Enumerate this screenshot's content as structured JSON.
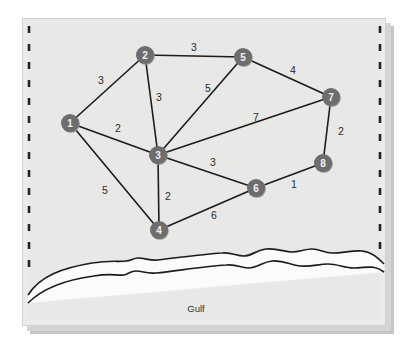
{
  "figure": {
    "region_label": "Gulf",
    "background_color": "#e8e8e6",
    "node_color": "#6d6d6d",
    "node_text_color": "#f2f2f2",
    "edge_color": "#1c1c1c",
    "border_color": "#1c1c1c",
    "shadow_color": "#b8b8b8",
    "frame_color": "#dcdcda"
  },
  "chart_data": {
    "type": "diagram",
    "nodes": [
      {
        "id": "1",
        "label": "1",
        "x": 70,
        "y": 123
      },
      {
        "id": "2",
        "label": "2",
        "x": 145,
        "y": 55
      },
      {
        "id": "3",
        "label": "3",
        "x": 158,
        "y": 155
      },
      {
        "id": "4",
        "label": "4",
        "x": 159,
        "y": 230
      },
      {
        "id": "5",
        "label": "5",
        "x": 243,
        "y": 57
      },
      {
        "id": "6",
        "label": "6",
        "x": 256,
        "y": 188
      },
      {
        "id": "7",
        "label": "7",
        "x": 331,
        "y": 97
      },
      {
        "id": "8",
        "label": "8",
        "x": 323,
        "y": 163
      }
    ],
    "edges": [
      {
        "from": "1",
        "to": "2",
        "weight": "3",
        "lx": 101,
        "ly": 80
      },
      {
        "from": "1",
        "to": "3",
        "weight": "2",
        "lx": 118,
        "ly": 128
      },
      {
        "from": "1",
        "to": "4",
        "weight": "5",
        "lx": 105,
        "ly": 190
      },
      {
        "from": "2",
        "to": "3",
        "weight": "3",
        "lx": 159,
        "ly": 97
      },
      {
        "from": "2",
        "to": "5",
        "weight": "3",
        "lx": 194,
        "ly": 47
      },
      {
        "from": "3",
        "to": "4",
        "weight": "2",
        "lx": 168,
        "ly": 196
      },
      {
        "from": "3",
        "to": "5",
        "weight": "5",
        "lx": 208,
        "ly": 88
      },
      {
        "from": "3",
        "to": "6",
        "weight": "3",
        "lx": 213,
        "ly": 162
      },
      {
        "from": "3",
        "to": "7",
        "weight": "7",
        "lx": 256,
        "ly": 117
      },
      {
        "from": "4",
        "to": "6",
        "weight": "6",
        "lx": 214,
        "ly": 215
      },
      {
        "from": "5",
        "to": "7",
        "weight": "4",
        "lx": 293,
        "ly": 70
      },
      {
        "from": "6",
        "to": "8",
        "weight": "1",
        "lx": 294,
        "ly": 184
      },
      {
        "from": "7",
        "to": "8",
        "weight": "2",
        "lx": 341,
        "ly": 131
      }
    ],
    "node_radius": 9,
    "edge_width": 1.6,
    "xlabel": "",
    "ylabel": "",
    "legend": []
  },
  "coastline": {
    "name": "gulf-coastline",
    "label": "Gulf",
    "label_x": 196,
    "label_y": 308,
    "upper_path": "M 28,295 C 40,276 62,268 92,263 C 112,260 118,262 126,261 C 131,261 133,258 138,258 C 146,258 149,261 158,260 C 182,257 206,254 222,253 C 232,252 236,256 244,256 C 252,256 256,250 266,249 C 278,248 284,252 292,252 C 300,252 304,249 312,249 C 320,249 324,253 332,253 C 344,253 352,250 362,251 C 372,252 378,258 384,264",
    "lower_path": "M 28,303 C 42,289 64,280 94,276 C 112,273 116,276 124,275 C 129,274 130,271 136,271 C 143,271 146,274 156,273 C 182,270 208,266 226,265 C 238,264 240,268 248,268 C 258,268 262,262 272,261 C 284,260 290,265 300,266 C 312,267 318,264 328,264 C 338,264 344,268 354,268 C 366,268 374,264 384,272"
  },
  "frame": {
    "name": "map-frame",
    "left": 22,
    "top": 18,
    "right": 386,
    "bottom": 326,
    "dash_left_x": 28,
    "dash_right_x": 380,
    "dash_top": 26,
    "dash_bottom": 272
  }
}
